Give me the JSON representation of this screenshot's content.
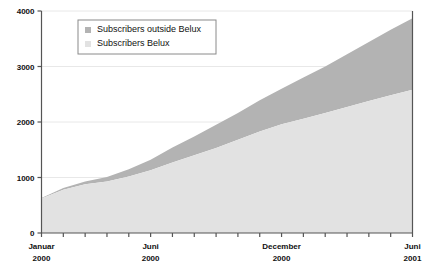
{
  "chart_data": {
    "type": "area",
    "stacked": true,
    "title": "",
    "subtitle": "",
    "xlabel": "",
    "ylabel": "",
    "ylim": [
      0,
      4000
    ],
    "yticks": [
      0,
      1000,
      2000,
      3000,
      4000
    ],
    "ytick_labels": [
      "0",
      "1000",
      "2000",
      "3000",
      "4000"
    ],
    "grid": true,
    "grid_axis": "y",
    "legend_position": "top-center",
    "x": [
      "Januar 2000",
      "Februar 2000",
      "Maerz 2000",
      "April 2000",
      "Mai 2000",
      "Juni 2000",
      "Juli 2000",
      "August 2000",
      "September 2000",
      "Oktober 2000",
      "November 2000",
      "December 2000",
      "Januar 2001",
      "Februar 2001",
      "Maerz 2001",
      "April 2001",
      "Mai 2001",
      "Juni 2001"
    ],
    "x_tick_labels_visible": [
      {
        "index": 0,
        "line1": "Januar",
        "line2": "2000"
      },
      {
        "index": 5,
        "line1": "Juni",
        "line2": "2000"
      },
      {
        "index": 11,
        "line1": "December",
        "line2": "2000"
      },
      {
        "index": 17,
        "line1": "Juni",
        "line2": "2001"
      }
    ],
    "series": [
      {
        "name": "Subscribers Belux",
        "color": "#e2e2e2",
        "values": [
          620,
          780,
          880,
          930,
          1020,
          1130,
          1270,
          1400,
          1530,
          1680,
          1830,
          1960,
          2060,
          2160,
          2270,
          2380,
          2480,
          2580
        ]
      },
      {
        "name": "Subscribers outside Belux",
        "color": "#b3b3b3",
        "values": [
          10,
          30,
          50,
          80,
          130,
          190,
          270,
          340,
          420,
          480,
          560,
          640,
          740,
          840,
          950,
          1060,
          1180,
          1290
        ]
      }
    ],
    "totals": [
      630,
      810,
      930,
      1010,
      1150,
      1320,
      1540,
      1740,
      1950,
      2160,
      2390,
      2600,
      2800,
      3000,
      3220,
      3440,
      3660,
      3870
    ]
  },
  "legend": {
    "items": [
      {
        "label": "Subscribers outside Belux",
        "swatch": "#b3b3b3"
      },
      {
        "label": "Subscribers Belux",
        "swatch": "#e2e2e2"
      }
    ]
  },
  "colors": {
    "axis": "#555555",
    "grid": "#e8e8e8",
    "area_belux": "#e2e2e2",
    "area_outside": "#b3b3b3",
    "text": "#111111",
    "legend_border": "#8a8a8a",
    "background": "#ffffff"
  }
}
